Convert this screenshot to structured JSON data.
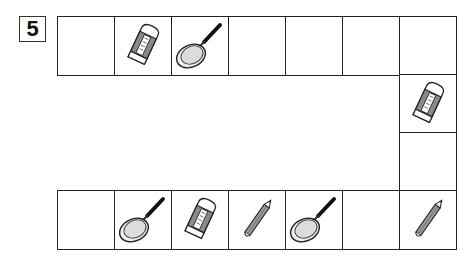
{
  "puzzle": {
    "number": "5",
    "description": "Path board of squares with pictures",
    "colors": {
      "line": "#222222",
      "fill_gray": "#dcdcdc",
      "handle": "#111111"
    },
    "cells": [
      {
        "row": "top",
        "col": 0,
        "item": "empty"
      },
      {
        "row": "top",
        "col": 1,
        "item": "eraser"
      },
      {
        "row": "top",
        "col": 2,
        "item": "frying-pan"
      },
      {
        "row": "top",
        "col": 3,
        "item": "empty"
      },
      {
        "row": "top",
        "col": 4,
        "item": "empty"
      },
      {
        "row": "top",
        "col": 5,
        "item": "empty"
      },
      {
        "row": "top",
        "col": 6,
        "item": "empty"
      },
      {
        "row": "right",
        "col": 6,
        "item": "eraser"
      },
      {
        "row": "right",
        "col": 6,
        "item": "empty"
      },
      {
        "row": "bottom",
        "col": 6,
        "item": "pencil"
      },
      {
        "row": "bottom",
        "col": 5,
        "item": "empty"
      },
      {
        "row": "bottom",
        "col": 4,
        "item": "frying-pan"
      },
      {
        "row": "bottom",
        "col": 3,
        "item": "pencil"
      },
      {
        "row": "bottom",
        "col": 2,
        "item": "eraser"
      },
      {
        "row": "bottom",
        "col": 1,
        "item": "frying-pan"
      },
      {
        "row": "bottom",
        "col": 0,
        "item": "empty"
      }
    ]
  }
}
